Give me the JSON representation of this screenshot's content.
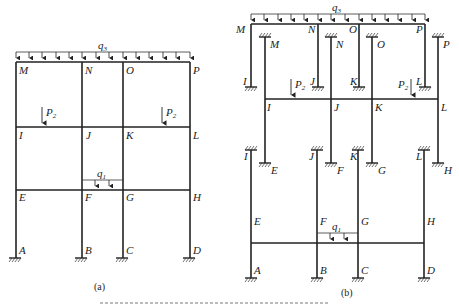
{
  "figure_a": {
    "caption": "(a)",
    "load_top": "q",
    "load_top_sub": "3",
    "load_mid": "q",
    "load_mid_sub": "1",
    "point_load": "P",
    "point_load_sub": "2",
    "nodes": {
      "M": "M",
      "N": "N",
      "O": "O",
      "P": "P",
      "I": "I",
      "J": "J",
      "K": "K",
      "L": "L",
      "E": "E",
      "F": "F",
      "G": "G",
      "H": "H",
      "A": "A",
      "B": "B",
      "C": "C",
      "D": "D"
    }
  },
  "figure_b": {
    "caption": "(b)",
    "load_top": "q",
    "load_top_sub": "3",
    "load_mid": "q",
    "load_mid_sub": "1",
    "point_load": "P",
    "point_load_sub": "2",
    "nodes": {
      "M": "M",
      "N": "N",
      "O": "O",
      "P": "P",
      "I": "I",
      "J": "J",
      "K": "K",
      "L": "L",
      "E": "E",
      "F": "F",
      "G": "G",
      "H": "H",
      "A": "A",
      "B": "B",
      "C": "C",
      "D": "D"
    }
  }
}
